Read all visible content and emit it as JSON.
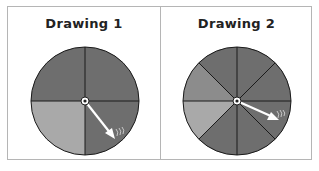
{
  "panels": [
    {
      "title": "Drawing 1",
      "sections": 4,
      "shaded_light_sections": 1,
      "colors": {
        "dark": "#6e6e6e",
        "light": "#a9a9a9"
      }
    },
    {
      "title": "Drawing 2",
      "sections": 8,
      "shaded_light_sections": 2,
      "colors": {
        "dark": "#6e6e6e",
        "medium": "#8c8c8c",
        "light": "#a9a9a9"
      }
    }
  ]
}
